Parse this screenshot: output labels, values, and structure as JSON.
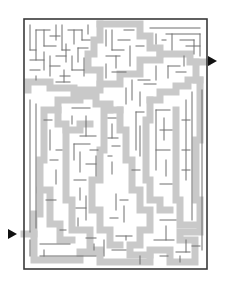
{
  "puzzle": {
    "type": "maze",
    "title": "Maze",
    "colors": {
      "background": "#ffffff",
      "path_shade": "#c9c9c9",
      "wall": "#6e6e6e",
      "border": "#3a3a3a",
      "arrow": "#111111"
    },
    "border": {
      "x": 24,
      "y": 19,
      "w": 183,
      "h": 250
    },
    "entrance_arrow": {
      "direction": "right",
      "x": 12,
      "y": 234,
      "label": "start-arrow"
    },
    "exit_arrow": {
      "direction": "left-pointing-right",
      "x": 211,
      "y": 61,
      "label": "end-arrow"
    },
    "shade_width": 7,
    "shaded_paths": [
      [
        [
          24,
          234
        ],
        [
          34,
          234
        ],
        [
          34,
          260
        ],
        [
          80,
          260
        ],
        [
          80,
          252
        ],
        [
          100,
          252
        ],
        [
          100,
          262
        ],
        [
          150,
          262
        ],
        [
          150,
          250
        ],
        [
          170,
          250
        ],
        [
          170,
          262
        ],
        [
          195,
          262
        ],
        [
          195,
          240
        ],
        [
          180,
          240
        ],
        [
          180,
          232
        ],
        [
          200,
          232
        ],
        [
          200,
          200
        ],
        [
          196,
          200
        ],
        [
          196,
          140
        ],
        [
          200,
          140
        ],
        [
          200,
          80
        ],
        [
          196,
          80
        ],
        [
          196,
          62
        ],
        [
          207,
          62
        ]
      ],
      [
        [
          34,
          234
        ],
        [
          34,
          214
        ],
        [
          40,
          214
        ],
        [
          40,
          160
        ],
        [
          44,
          160
        ],
        [
          44,
          110
        ],
        [
          58,
          110
        ],
        [
          58,
          100
        ],
        [
          80,
          100
        ],
        [
          80,
          90
        ],
        [
          100,
          90
        ],
        [
          100,
          84
        ],
        [
          120,
          84
        ],
        [
          120,
          74
        ],
        [
          140,
          74
        ],
        [
          140,
          60
        ],
        [
          160,
          60
        ],
        [
          160,
          54
        ],
        [
          190,
          54
        ],
        [
          190,
          62
        ],
        [
          196,
          62
        ]
      ],
      [
        [
          58,
          110
        ],
        [
          58,
          124
        ],
        [
          66,
          124
        ],
        [
          66,
          200
        ],
        [
          72,
          200
        ],
        [
          72,
          230
        ],
        [
          90,
          230
        ],
        [
          90,
          250
        ],
        [
          100,
          250
        ]
      ],
      [
        [
          28,
          90
        ],
        [
          28,
          82
        ],
        [
          50,
          82
        ],
        [
          50,
          88
        ],
        [
          74,
          88
        ],
        [
          74,
          96
        ],
        [
          96,
          96
        ],
        [
          96,
          104
        ],
        [
          110,
          104
        ],
        [
          110,
          110
        ],
        [
          120,
          110
        ]
      ],
      [
        [
          100,
          24
        ],
        [
          100,
          40
        ],
        [
          94,
          40
        ],
        [
          94,
          54
        ],
        [
          88,
          54
        ],
        [
          88,
          70
        ],
        [
          100,
          70
        ],
        [
          100,
          84
        ]
      ],
      [
        [
          100,
          24
        ],
        [
          140,
          24
        ],
        [
          140,
          36
        ],
        [
          150,
          36
        ],
        [
          150,
          48
        ],
        [
          160,
          48
        ],
        [
          160,
          54
        ]
      ],
      [
        [
          120,
          110
        ],
        [
          120,
          130
        ],
        [
          126,
          130
        ],
        [
          126,
          160
        ],
        [
          132,
          160
        ],
        [
          132,
          190
        ],
        [
          140,
          190
        ],
        [
          140,
          210
        ],
        [
          150,
          210
        ],
        [
          150,
          230
        ],
        [
          140,
          230
        ],
        [
          140,
          245
        ],
        [
          130,
          245
        ],
        [
          130,
          255
        ],
        [
          150,
          255
        ]
      ],
      [
        [
          110,
          110
        ],
        [
          104,
          110
        ],
        [
          104,
          150
        ],
        [
          100,
          150
        ],
        [
          100,
          180
        ],
        [
          92,
          180
        ],
        [
          92,
          210
        ],
        [
          100,
          210
        ],
        [
          100,
          230
        ],
        [
          110,
          230
        ],
        [
          110,
          245
        ],
        [
          120,
          245
        ]
      ],
      [
        [
          150,
          100
        ],
        [
          160,
          100
        ],
        [
          160,
          92
        ],
        [
          176,
          92
        ],
        [
          176,
          86
        ],
        [
          188,
          86
        ],
        [
          188,
          80
        ],
        [
          200,
          80
        ]
      ],
      [
        [
          150,
          100
        ],
        [
          150,
          120
        ],
        [
          146,
          120
        ],
        [
          146,
          180
        ],
        [
          150,
          180
        ],
        [
          150,
          200
        ],
        [
          160,
          200
        ],
        [
          160,
          210
        ],
        [
          170,
          210
        ]
      ],
      [
        [
          176,
          110
        ],
        [
          176,
          200
        ],
        [
          180,
          200
        ],
        [
          180,
          225
        ],
        [
          196,
          225
        ]
      ],
      [
        [
          66,
          130
        ],
        [
          80,
          130
        ],
        [
          80,
          124
        ],
        [
          90,
          124
        ]
      ],
      [
        [
          40,
          190
        ],
        [
          50,
          190
        ],
        [
          50,
          224
        ],
        [
          60,
          224
        ],
        [
          60,
          240
        ],
        [
          72,
          240
        ]
      ]
    ],
    "walls": [
      [
        30,
        25,
        30,
        50
      ],
      [
        30,
        50,
        36,
        50
      ],
      [
        36,
        30,
        36,
        60
      ],
      [
        36,
        30,
        50,
        30
      ],
      [
        44,
        30,
        44,
        46
      ],
      [
        44,
        46,
        56,
        46
      ],
      [
        50,
        36,
        60,
        36
      ],
      [
        56,
        25,
        56,
        40
      ],
      [
        62,
        25,
        62,
        50
      ],
      [
        62,
        50,
        70,
        50
      ],
      [
        68,
        30,
        82,
        30
      ],
      [
        74,
        30,
        74,
        44
      ],
      [
        82,
        30,
        82,
        40
      ],
      [
        82,
        40,
        90,
        40
      ],
      [
        88,
        25,
        88,
        34
      ],
      [
        30,
        60,
        44,
        60
      ],
      [
        44,
        52,
        44,
        70
      ],
      [
        50,
        56,
        50,
        76
      ],
      [
        50,
        66,
        60,
        66
      ],
      [
        56,
        56,
        66,
        56
      ],
      [
        66,
        44,
        66,
        62
      ],
      [
        72,
        56,
        72,
        70
      ],
      [
        72,
        70,
        84,
        70
      ],
      [
        78,
        48,
        78,
        62
      ],
      [
        78,
        48,
        88,
        48
      ],
      [
        84,
        58,
        84,
        76
      ],
      [
        60,
        76,
        70,
        76
      ],
      [
        30,
        70,
        40,
        70
      ],
      [
        36,
        76,
        36,
        80
      ],
      [
        56,
        82,
        70,
        82
      ],
      [
        64,
        70,
        64,
        82
      ],
      [
        106,
        30,
        106,
        46
      ],
      [
        112,
        30,
        112,
        50
      ],
      [
        112,
        50,
        124,
        50
      ],
      [
        118,
        40,
        130,
        40
      ],
      [
        124,
        30,
        134,
        30
      ],
      [
        130,
        46,
        130,
        66
      ],
      [
        136,
        46,
        144,
        46
      ],
      [
        106,
        56,
        120,
        56
      ],
      [
        116,
        56,
        116,
        68
      ],
      [
        106,
        64,
        106,
        78
      ],
      [
        112,
        72,
        126,
        72
      ],
      [
        150,
        28,
        200,
        28
      ],
      [
        156,
        34,
        156,
        44
      ],
      [
        166,
        34,
        200,
        34
      ],
      [
        172,
        34,
        172,
        50
      ],
      [
        180,
        40,
        194,
        40
      ],
      [
        186,
        46,
        200,
        46
      ],
      [
        194,
        40,
        194,
        54
      ],
      [
        200,
        34,
        200,
        56
      ],
      [
        162,
        40,
        166,
        40
      ],
      [
        132,
        80,
        132,
        100
      ],
      [
        138,
        80,
        150,
        80
      ],
      [
        126,
        88,
        126,
        104
      ],
      [
        140,
        92,
        140,
        106
      ],
      [
        144,
        84,
        156,
        84
      ],
      [
        156,
        66,
        156,
        80
      ],
      [
        168,
        66,
        168,
        78
      ],
      [
        168,
        66,
        180,
        66
      ],
      [
        176,
        72,
        186,
        72
      ],
      [
        184,
        56,
        184,
        66
      ],
      [
        108,
        118,
        116,
        118
      ],
      [
        112,
        124,
        112,
        138
      ],
      [
        108,
        138,
        118,
        138
      ],
      [
        112,
        146,
        120,
        146
      ],
      [
        108,
        156,
        112,
        156
      ],
      [
        112,
        162,
        112,
        174
      ],
      [
        30,
        100,
        30,
        232
      ],
      [
        36,
        104,
        36,
        228
      ],
      [
        44,
        120,
        52,
        120
      ],
      [
        50,
        130,
        50,
        150
      ],
      [
        56,
        150,
        62,
        150
      ],
      [
        50,
        160,
        58,
        160
      ],
      [
        56,
        170,
        56,
        184
      ],
      [
        46,
        200,
        56,
        200
      ],
      [
        72,
        108,
        90,
        108
      ],
      [
        72,
        116,
        72,
        124
      ],
      [
        86,
        116,
        86,
        136
      ],
      [
        80,
        136,
        96,
        136
      ],
      [
        74,
        144,
        90,
        144
      ],
      [
        74,
        144,
        74,
        160
      ],
      [
        80,
        152,
        80,
        172
      ],
      [
        86,
        164,
        96,
        164
      ],
      [
        74,
        180,
        86,
        180
      ],
      [
        80,
        188,
        80,
        200
      ],
      [
        86,
        196,
        86,
        220
      ],
      [
        76,
        208,
        86,
        208
      ],
      [
        78,
        218,
        78,
        226
      ],
      [
        90,
        150,
        98,
        150
      ],
      [
        96,
        156,
        96,
        176
      ],
      [
        136,
        112,
        136,
        150
      ],
      [
        136,
        112,
        144,
        112
      ],
      [
        140,
        126,
        140,
        156
      ],
      [
        132,
        170,
        140,
        170
      ],
      [
        156,
        110,
        156,
        170
      ],
      [
        156,
        110,
        170,
        110
      ],
      [
        164,
        118,
        164,
        140
      ],
      [
        160,
        130,
        172,
        130
      ],
      [
        156,
        150,
        170,
        150
      ],
      [
        166,
        160,
        166,
        176
      ],
      [
        160,
        184,
        172,
        184
      ],
      [
        186,
        100,
        186,
        180
      ],
      [
        192,
        92,
        192,
        220
      ],
      [
        182,
        120,
        190,
        120
      ],
      [
        182,
        150,
        190,
        150
      ],
      [
        182,
        170,
        190,
        170
      ],
      [
        202,
        90,
        202,
        250
      ],
      [
        160,
        220,
        176,
        220
      ],
      [
        166,
        226,
        166,
        240
      ],
      [
        154,
        240,
        174,
        240
      ],
      [
        186,
        240,
        186,
        252
      ],
      [
        176,
        252,
        190,
        252
      ],
      [
        116,
        194,
        116,
        210
      ],
      [
        120,
        200,
        128,
        200
      ],
      [
        124,
        206,
        124,
        222
      ],
      [
        110,
        218,
        118,
        218
      ],
      [
        116,
        236,
        132,
        236
      ],
      [
        126,
        236,
        126,
        240
      ],
      [
        104,
        240,
        104,
        256
      ],
      [
        112,
        250,
        126,
        250
      ],
      [
        30,
        240,
        30,
        256
      ],
      [
        40,
        244,
        70,
        244
      ],
      [
        44,
        250,
        44,
        256
      ],
      [
        40,
        256,
        96,
        256
      ],
      [
        60,
        230,
        66,
        230
      ],
      [
        86,
        238,
        96,
        238
      ],
      [
        94,
        244,
        94,
        250
      ],
      [
        140,
        256,
        140,
        264
      ],
      [
        160,
        256,
        168,
        256
      ],
      [
        180,
        256,
        180,
        262
      ],
      [
        192,
        246,
        200,
        246
      ]
    ]
  }
}
